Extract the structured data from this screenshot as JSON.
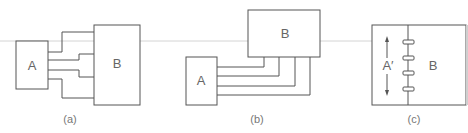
{
  "figure": {
    "panels": [
      {
        "id": "a",
        "caption": "(a)",
        "box_a_label": "A",
        "box_b_label": "B",
        "connections": 4,
        "layout": "side-by-side, A left of B, wires jog to spread along B's left edge"
      },
      {
        "id": "b",
        "caption": "(b)",
        "box_a_label": "A",
        "box_b_label": "B",
        "connections": 4,
        "layout": "A lower-left, B upper-right, wires run right then up into B's bottom edge"
      },
      {
        "id": "c",
        "caption": "(c)",
        "box_a_label": "A′",
        "box_b_label": "B",
        "connections": 4,
        "layout": "A' and B share a common edge joined by 4 connector tabs; arrows indicate A' vertical extent"
      }
    ],
    "colors": {
      "line": "#555555",
      "label": "#666666",
      "caption": "#777777",
      "guide_line": "#d4d4d4",
      "background": "#ffffff"
    }
  }
}
